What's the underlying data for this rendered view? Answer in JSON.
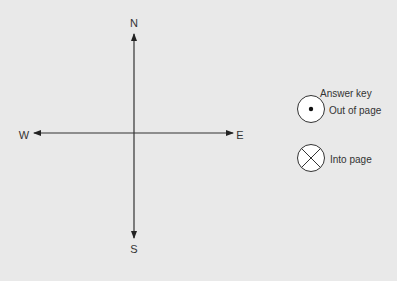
{
  "compass": {
    "north": "N",
    "south": "S",
    "east": "E",
    "west": "W"
  },
  "answer_key": {
    "title": "Answer key",
    "items": [
      {
        "icon": "dot-in-circle-icon",
        "label": "Out of page"
      },
      {
        "icon": "x-in-circle-icon",
        "label": "Into page"
      }
    ]
  },
  "colors": {
    "background": "#e9e9e9",
    "line": "#222222",
    "symbol_fill": "#ffffff"
  }
}
